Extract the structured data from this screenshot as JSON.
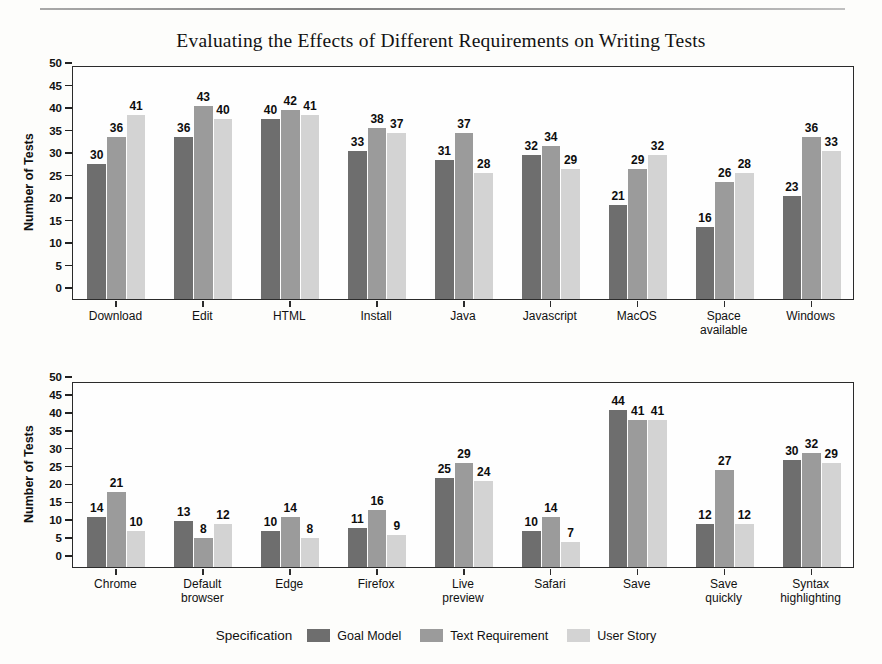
{
  "figure": {
    "title": "Evaluating the Effects of Different Requirements on Writing Tests",
    "ylabel": "Number of Tests",
    "legend_title": "Specification"
  },
  "colors": {
    "goal_model": "#6e6e6e",
    "text_requirement": "#9b9b9b",
    "user_story": "#d3d3d3",
    "axis": "#2b2b2b",
    "background": "#fdfdfb"
  },
  "legend": {
    "title": "Specification",
    "items": [
      {
        "label": "Goal Model",
        "color": "#6e6e6e"
      },
      {
        "label": "Text Requirement",
        "color": "#9b9b9b"
      },
      {
        "label": "User Story",
        "color": "#d3d3d3"
      }
    ]
  },
  "yaxis": {
    "ticks": [
      "0",
      "5",
      "10",
      "15",
      "20",
      "25",
      "30",
      "35",
      "40",
      "45",
      "50"
    ],
    "min": 0,
    "max": 52
  },
  "chart_data": [
    {
      "type": "bar",
      "title": "Evaluating the Effects of Different Requirements on Writing Tests",
      "panel": "top",
      "xlabel": "",
      "ylabel": "Number of Tests",
      "ylim": [
        0,
        52
      ],
      "yticks": [
        0,
        5,
        10,
        15,
        20,
        25,
        30,
        35,
        40,
        45,
        50
      ],
      "grid": false,
      "legend_position": "bottom",
      "categories": [
        "Download",
        "Edit",
        "HTML",
        "Install",
        "Java",
        "Javascript",
        "MacOS",
        "Space\navailable",
        "Windows"
      ],
      "series": [
        {
          "name": "Goal Model",
          "color": "#6e6e6e",
          "values": [
            30,
            36,
            40,
            33,
            31,
            32,
            21,
            16,
            23
          ]
        },
        {
          "name": "Text Requirement",
          "color": "#9b9b9b",
          "values": [
            36,
            43,
            42,
            38,
            37,
            34,
            29,
            26,
            36
          ]
        },
        {
          "name": "User Story",
          "color": "#d3d3d3",
          "values": [
            41,
            40,
            41,
            37,
            28,
            29,
            32,
            28,
            33
          ]
        }
      ]
    },
    {
      "type": "bar",
      "title": "",
      "panel": "bottom",
      "xlabel": "",
      "ylabel": "Number of Tests",
      "ylim": [
        0,
        52
      ],
      "yticks": [
        0,
        5,
        10,
        15,
        20,
        25,
        30,
        35,
        40,
        45,
        50
      ],
      "grid": false,
      "legend_position": "bottom",
      "categories": [
        "Chrome",
        "Default\nbrowser",
        "Edge",
        "Firefox",
        "Live\npreview",
        "Safari",
        "Save",
        "Save\nquickly",
        "Syntax\nhighlighting"
      ],
      "series": [
        {
          "name": "Goal Model",
          "color": "#6e6e6e",
          "values": [
            14,
            13,
            10,
            11,
            25,
            10,
            44,
            12,
            30
          ]
        },
        {
          "name": "Text Requirement",
          "color": "#9b9b9b",
          "values": [
            21,
            8,
            14,
            16,
            29,
            14,
            41,
            27,
            32
          ]
        },
        {
          "name": "User Story",
          "color": "#d3d3d3",
          "values": [
            10,
            12,
            8,
            9,
            24,
            7,
            41,
            12,
            29
          ]
        }
      ]
    }
  ]
}
